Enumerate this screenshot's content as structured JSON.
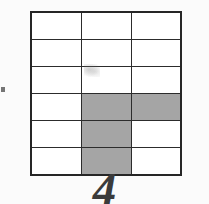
{
  "figure": {
    "label": "4",
    "background_color": "#fbfbfb",
    "border_color": "#262626",
    "grid_line_color": "#2c2c2c",
    "shade_color": "#4b4b4b",
    "cell_fill_color": "#ffffff"
  },
  "grid": {
    "columns": 3,
    "rows": 6,
    "shaded_count": 4,
    "unshaded_count": 14,
    "cells": [
      [
        {
          "row": 1,
          "col": 1,
          "shaded": false
        },
        {
          "row": 1,
          "col": 2,
          "shaded": false
        },
        {
          "row": 1,
          "col": 3,
          "shaded": false
        }
      ],
      [
        {
          "row": 2,
          "col": 1,
          "shaded": false
        },
        {
          "row": 2,
          "col": 2,
          "shaded": false
        },
        {
          "row": 2,
          "col": 3,
          "shaded": false
        }
      ],
      [
        {
          "row": 3,
          "col": 1,
          "shaded": false
        },
        {
          "row": 3,
          "col": 2,
          "shaded": false
        },
        {
          "row": 3,
          "col": 3,
          "shaded": false
        }
      ],
      [
        {
          "row": 4,
          "col": 1,
          "shaded": false
        },
        {
          "row": 4,
          "col": 2,
          "shaded": true
        },
        {
          "row": 4,
          "col": 3,
          "shaded": true
        }
      ],
      [
        {
          "row": 5,
          "col": 1,
          "shaded": false
        },
        {
          "row": 5,
          "col": 2,
          "shaded": true
        },
        {
          "row": 5,
          "col": 3,
          "shaded": false
        }
      ],
      [
        {
          "row": 6,
          "col": 1,
          "shaded": false
        },
        {
          "row": 6,
          "col": 2,
          "shaded": true
        },
        {
          "row": 6,
          "col": 3,
          "shaded": false
        }
      ]
    ]
  },
  "artifacts": {
    "edge_tick": "left-edge-tick-mark",
    "smudge": "faint-scan-smudge-row3-col2"
  }
}
